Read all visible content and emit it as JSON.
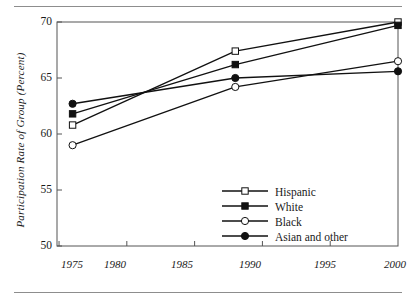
{
  "chart_data": {
    "type": "line",
    "title": "",
    "xlabel": "",
    "ylabel": "Participation Rate of Group (Percent)",
    "xlim": [
      1974.85,
      2000.0
    ],
    "ylim": [
      50,
      70
    ],
    "xticks": [
      1975,
      1980,
      1985,
      1990,
      1995,
      2000
    ],
    "xtick_labels": [
      "1975",
      "1980",
      "1985",
      "1990",
      "1995",
      "2000"
    ],
    "yticks": [
      50,
      55,
      60,
      65,
      70
    ],
    "ytick_labels": [
      "50",
      "55",
      "60",
      "65",
      "70"
    ],
    "grid": false,
    "legend_position": "center-right-inside",
    "x": [
      1976,
      1988,
      2000
    ],
    "series": [
      {
        "name": "Hispanic",
        "marker": "open-square",
        "values": [
          60.8,
          67.4,
          70.0
        ]
      },
      {
        "name": "White",
        "marker": "filled-square",
        "values": [
          61.8,
          66.2,
          69.7
        ]
      },
      {
        "name": "Black",
        "marker": "open-circle",
        "values": [
          59.0,
          64.2,
          66.5
        ]
      },
      {
        "name": "Asian and other",
        "marker": "filled-circle",
        "values": [
          62.7,
          65.0,
          65.6
        ]
      }
    ],
    "colors": {
      "line": "#111111",
      "axis": "#555555",
      "text": "#1a1a1a",
      "rule": "#8d8d8d",
      "marker_fill_open": "#ffffff",
      "marker_fill_closed": "#111111"
    }
  },
  "legend": {
    "entries": [
      {
        "label": "Hispanic"
      },
      {
        "label": "White"
      },
      {
        "label": "Black"
      },
      {
        "label": "Asian and other"
      }
    ]
  },
  "axes": {
    "y_title": "Participation Rate of Group (Percent)",
    "y_labels": [
      "70",
      "65",
      "60",
      "55",
      "50"
    ],
    "x_labels": [
      "1975",
      "1980",
      "1985",
      "1990",
      "1995",
      "2000"
    ]
  }
}
